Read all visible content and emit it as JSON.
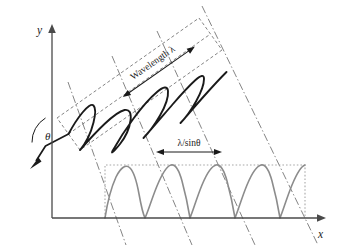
{
  "figure": {
    "type": "diagram",
    "background_color": "#ffffff"
  },
  "axes": {
    "y_label": "y",
    "x_label": "x",
    "y_axis_color": "#4a4a4a",
    "x_axis_color": "#4a4a4a",
    "origin_px": [
      52,
      218
    ],
    "y_top_px": [
      52,
      28
    ],
    "x_right_px": [
      325,
      218
    ]
  },
  "angle": {
    "label": "θ",
    "description": "angle between the vertical and the incident propagation direction",
    "value_deg": 55,
    "vertex_px": [
      48,
      128
    ],
    "arc_color": "#1a1a1a"
  },
  "incident_ray": {
    "description": "arrow showing incident wave direction pointing down-left",
    "color": "#1a1a1a",
    "tip_px": [
      31,
      163
    ],
    "tail_px": [
      68,
      143
    ]
  },
  "tilted_wave": {
    "label": "Wavelength λ",
    "wavelength_label": "Wavelength λ",
    "color": "#1a1a1a",
    "tilt_deg": -35,
    "cycles": 4,
    "bounding_box_style": "dashed",
    "bounding_box_color": "#6e6e6e"
  },
  "projected_wave": {
    "label": "λ/sinθ",
    "spacing_label": "λ/sinθ",
    "color": "#8c8c8c",
    "cycles": 4,
    "bounding_box_style": "dotted",
    "bounding_box_color": "#a8a8a8",
    "baseline_y_px": 218
  },
  "projection_lines": {
    "style": "dash-dot",
    "color": "#6e6e6e",
    "count": 4,
    "description": "dash-dot lines projecting tilted wave crests down onto the x-axis"
  },
  "measures": [
    {
      "name": "wavelength",
      "label": "Wavelength λ",
      "orientation": "tilted",
      "rotation_deg": -35
    },
    {
      "name": "projected-spacing",
      "label": "λ/sinθ",
      "orientation": "horizontal",
      "rotation_deg": 0
    }
  ],
  "colors": {
    "ink": "#1a1a1a",
    "axis": "#4a4a4a",
    "gray_wave": "#8c8c8c",
    "dash_gray": "#6e6e6e",
    "dot_gray": "#a8a8a8"
  }
}
